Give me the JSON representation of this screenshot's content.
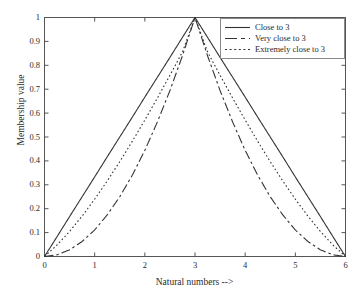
{
  "chart_data": {
    "type": "line",
    "title": "",
    "xlabel": "Natural numbers -->",
    "ylabel": "Membership value",
    "xlim": [
      0,
      6
    ],
    "ylim": [
      0,
      1
    ],
    "grid": false,
    "legend_position": "upper right",
    "xticks": [
      "0",
      "1",
      "2",
      "3",
      "4",
      "5",
      "6"
    ],
    "xtick_values": [
      0,
      1,
      2,
      3,
      4,
      5,
      6
    ],
    "yticks": [
      "0",
      "0.1",
      "0.2",
      "0.3",
      "0.4",
      "0.5",
      "0.6",
      "0.7",
      "0.8",
      "0.9",
      "1"
    ],
    "ytick_values": [
      0,
      0.1,
      0.2,
      0.3,
      0.4,
      0.5,
      0.6,
      0.7,
      0.8,
      0.9,
      1
    ],
    "line_color": "#333333",
    "x": [
      0,
      0.25,
      0.5,
      0.75,
      1,
      1.25,
      1.5,
      1.75,
      2,
      2.25,
      2.5,
      2.75,
      3,
      3.25,
      3.5,
      3.75,
      4,
      4.25,
      4.5,
      4.75,
      5,
      5.25,
      5.5,
      5.75,
      6
    ],
    "series": [
      {
        "name": "Close to 3",
        "style": "solid",
        "values": [
          0,
          0.083,
          0.167,
          0.25,
          0.333,
          0.417,
          0.5,
          0.583,
          0.667,
          0.75,
          0.833,
          0.917,
          1,
          0.917,
          0.833,
          0.75,
          0.667,
          0.583,
          0.5,
          0.417,
          0.333,
          0.25,
          0.167,
          0.083,
          0
        ]
      },
      {
        "name": "Very close to 3",
        "style": "dashed",
        "values": [
          0,
          0.007,
          0.028,
          0.063,
          0.111,
          0.174,
          0.25,
          0.34,
          0.444,
          0.563,
          0.694,
          0.84,
          1,
          0.84,
          0.694,
          0.563,
          0.444,
          0.34,
          0.25,
          0.174,
          0.111,
          0.063,
          0.028,
          0.007,
          0
        ]
      },
      {
        "name": "Extremely close to 3",
        "style": "dotted",
        "values": [
          0,
          0.048,
          0.105,
          0.169,
          0.24,
          0.316,
          0.397,
          0.482,
          0.571,
          0.663,
          0.758,
          0.856,
          1,
          0.856,
          0.758,
          0.663,
          0.571,
          0.482,
          0.397,
          0.316,
          0.24,
          0.169,
          0.105,
          0.048,
          0
        ]
      }
    ]
  },
  "legend": {
    "entries": [
      {
        "label": "Close to 3"
      },
      {
        "label": "Very close to 3"
      },
      {
        "label": "Extremely close to 3"
      }
    ]
  }
}
